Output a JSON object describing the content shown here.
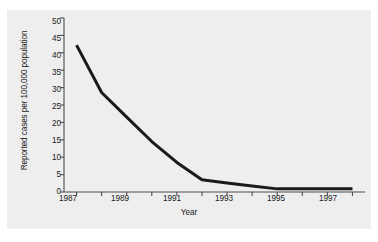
{
  "chart_data": {
    "type": "line",
    "title": "",
    "xlabel": "Year",
    "ylabel": "Reported cases per 100,000 population",
    "x": [
      1987,
      1988,
      1989,
      1990,
      1991,
      1992,
      1993,
      1994,
      1995,
      1996,
      1997,
      1998
    ],
    "values": [
      42.2,
      28.6,
      21.5,
      14.5,
      8.5,
      3.5,
      2.6,
      1.7,
      0.9,
      0.9,
      0.9,
      0.9
    ],
    "series": [
      {
        "name": "Reported cases per 100,000 population",
        "values": [
          42.2,
          28.6,
          21.5,
          14.5,
          8.5,
          3.5,
          2.6,
          1.7,
          0.9,
          0.9,
          0.9,
          0.9
        ]
      }
    ],
    "xlim": [
      1986.5,
      1998.5
    ],
    "ylim": [
      0,
      50
    ],
    "yticks": [
      0,
      5,
      10,
      15,
      20,
      25,
      30,
      35,
      40,
      45,
      50
    ],
    "ytick_labels": [
      "0",
      "5",
      "10",
      "15",
      "20",
      "25",
      "30",
      "35",
      "40",
      "45",
      "50"
    ],
    "xticks": [
      1987,
      1988,
      1989,
      1990,
      1991,
      1992,
      1993,
      1994,
      1995,
      1996,
      1997,
      1998
    ],
    "xtick_labels_shown": [
      "1987",
      "1989",
      "1991",
      "1993",
      "1995",
      "1997"
    ],
    "xtick_labels_shown_at": [
      1987,
      1989,
      1991,
      1993,
      1995,
      1997
    ],
    "grid": false,
    "legend": null,
    "line_color": "#1a1a1a",
    "line_width": 3,
    "background_color": "#eeeeee",
    "axis_color": "#4d4d4d",
    "figure_background": "#ffffff"
  }
}
